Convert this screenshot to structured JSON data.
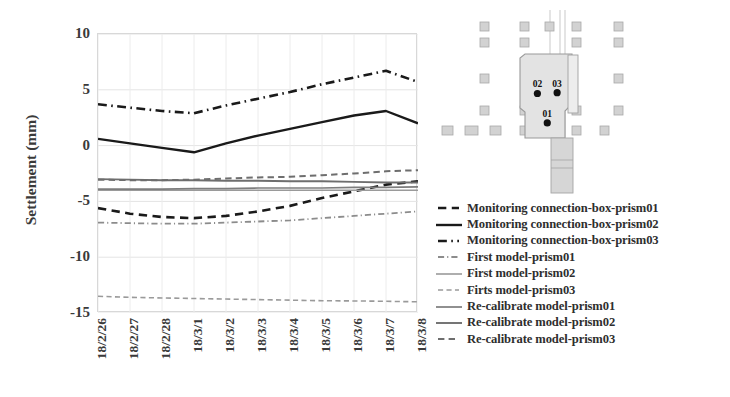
{
  "chart_data": {
    "type": "line",
    "title": "",
    "xlabel": "",
    "ylabel": "Settlement (mm)",
    "ylim": [
      -15,
      10
    ],
    "yticks": [
      10,
      5,
      0,
      -5,
      -10,
      -15
    ],
    "grid": true,
    "legend_position": "right",
    "categories": [
      "18/2/26",
      "18/2/27",
      "18/2/28",
      "18/3/1",
      "18/3/2",
      "18/3/3",
      "18/3/4",
      "18/3/5",
      "18/3/6",
      "18/3/7",
      "18/3/8"
    ],
    "series": [
      {
        "name": "Monitoring connection-box-prism01",
        "style": "dashed",
        "color": "#1a1a1a",
        "width": 2.6,
        "values": [
          -5.6,
          -6.1,
          -6.4,
          -6.5,
          -6.3,
          -5.9,
          -5.4,
          -4.7,
          -4.1,
          -3.5,
          -3.2
        ]
      },
      {
        "name": "Monitoring connection-box-prism02",
        "style": "solid",
        "color": "#1a1a1a",
        "width": 2.4,
        "values": [
          0.6,
          0.2,
          -0.2,
          -0.6,
          0.2,
          0.9,
          1.5,
          2.1,
          2.7,
          3.1,
          2.0
        ]
      },
      {
        "name": "Monitoring connection-box-prism03",
        "style": "dashdot",
        "color": "#1a1a1a",
        "width": 2.6,
        "values": [
          3.7,
          3.4,
          3.1,
          2.9,
          3.6,
          4.2,
          4.8,
          5.5,
          6.1,
          6.7,
          5.7
        ]
      },
      {
        "name": "First model-prism01",
        "style": "dashdot",
        "color": "#8c8c8c",
        "width": 1.8,
        "values": [
          -6.9,
          -6.95,
          -7.0,
          -7.0,
          -6.9,
          -6.8,
          -6.7,
          -6.5,
          -6.3,
          -6.1,
          -5.9
        ]
      },
      {
        "name": "First model-prism02",
        "style": "solid",
        "color": "#9a9a9a",
        "width": 1.6,
        "values": [
          -4.0,
          -4.0,
          -4.0,
          -4.0,
          -4.0,
          -4.0,
          -4.0,
          -4.0,
          -4.0,
          -4.0,
          -4.0
        ]
      },
      {
        "name": "Firts model-prism03",
        "style": "dashed",
        "color": "#9a9a9a",
        "width": 1.6,
        "values": [
          -13.5,
          -13.6,
          -13.65,
          -13.7,
          -13.75,
          -13.8,
          -13.85,
          -13.9,
          -13.92,
          -13.95,
          -14.0
        ]
      },
      {
        "name": "Re-calibrate model-prism01",
        "style": "solid",
        "color": "#7d7d7d",
        "width": 1.7,
        "values": [
          -3.9,
          -3.9,
          -3.9,
          -3.85,
          -3.85,
          -3.8,
          -3.8,
          -3.8,
          -3.75,
          -3.75,
          -3.7
        ]
      },
      {
        "name": "Re-calibrate model-prism02",
        "style": "solid",
        "color": "#6e6e6e",
        "width": 1.9,
        "values": [
          -3.0,
          -3.05,
          -3.1,
          -3.1,
          -3.15,
          -3.15,
          -3.2,
          -3.2,
          -3.25,
          -3.3,
          -3.3
        ]
      },
      {
        "name": "Re-calibrate model-prism03",
        "style": "dashed",
        "color": "#6e6e6e",
        "width": 2.0,
        "values": [
          -3.05,
          -3.1,
          -3.1,
          -3.05,
          -2.95,
          -2.85,
          -2.8,
          -2.65,
          -2.5,
          -2.3,
          -2.2
        ]
      }
    ]
  },
  "plan": {
    "markers": [
      {
        "label": "02",
        "x": 0.3,
        "y": 0.47
      },
      {
        "label": "03",
        "x": 0.64,
        "y": 0.46
      },
      {
        "label": "01",
        "x": 0.47,
        "y": 0.82
      }
    ]
  }
}
